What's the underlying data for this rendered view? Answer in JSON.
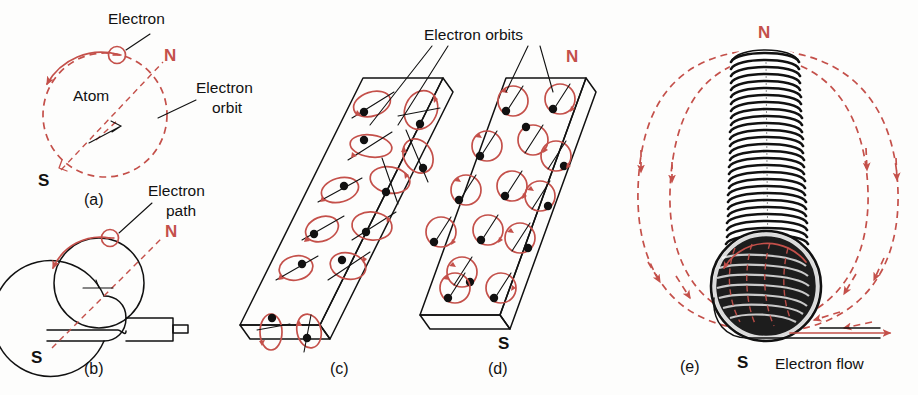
{
  "figure": {
    "colors": {
      "ink": "#111111",
      "accent_red": "#c4504a",
      "background": "#fdfdfc"
    }
  },
  "labels": {
    "electron": "Electron",
    "atom": "Atom",
    "electron_orbit": "Electron\norbit",
    "electron_orbit_line1": "Electron",
    "electron_orbit_line2": "orbit",
    "electron_path_line1": "Electron",
    "electron_path_line2": "path",
    "electron_orbits": "Electron orbits",
    "electron_flow": "Electron flow",
    "north": "N",
    "south": "S"
  },
  "panels": [
    {
      "id": "a",
      "caption": "(a)",
      "description": "Single atom with orbiting electron, magnetic axis N-S",
      "poles": {
        "north": "N",
        "south": "S"
      },
      "annotations": [
        "Electron",
        "Atom",
        "Electron orbit"
      ]
    },
    {
      "id": "b",
      "caption": "(b)",
      "description": "Loop of wire with electron path, magnetic axis N-S",
      "poles": {
        "north": "N",
        "south": "S"
      },
      "annotations": [
        "Electron path"
      ]
    },
    {
      "id": "c",
      "caption": "(c)",
      "description": "Bar of unmagnetized material, electron orbits randomly oriented",
      "poles": {
        "north": "",
        "south": ""
      },
      "annotations": [
        "Electron orbits"
      ],
      "orbit_count": 16,
      "orbit_alignment": "random"
    },
    {
      "id": "d",
      "caption": "(d)",
      "description": "Bar of magnetized material, electron orbits aligned",
      "poles": {
        "north": "N",
        "south": "S"
      },
      "annotations": [
        "Electron orbits"
      ],
      "orbit_count": 14,
      "orbit_alignment": "aligned"
    },
    {
      "id": "e",
      "caption": "(e)",
      "description": "Solenoid coil with magnetic field lines and electron flow in lead wire",
      "poles": {
        "north": "N",
        "south": "S"
      },
      "annotations": [
        "Electron flow"
      ],
      "turn_count": 34,
      "field_line_count": 4
    }
  ],
  "panel_captions": {
    "a": "(a)",
    "b": "(b)",
    "c": "(c)",
    "d": "(d)",
    "e": "(e)"
  }
}
